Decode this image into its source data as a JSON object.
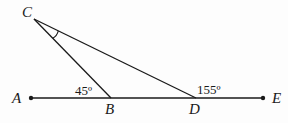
{
  "diagram": {
    "points": [
      {
        "name": "A",
        "x": 31,
        "y": 98
      },
      {
        "name": "B",
        "x": 111,
        "y": 98
      },
      {
        "name": "C",
        "x": 34,
        "y": 19
      },
      {
        "name": "D",
        "x": 196,
        "y": 98
      },
      {
        "name": "E",
        "x": 263,
        "y": 98
      }
    ],
    "labels": {
      "A": "A",
      "B": "B",
      "C": "C",
      "D": "D",
      "E": "E"
    },
    "angles": {
      "angle_CBA": "45º",
      "angle_CDE": "155º"
    },
    "segments": [
      "AE",
      "CB",
      "CD"
    ],
    "marked_angle": "BCD",
    "colors": {
      "stroke": "#1a1a1a",
      "background": "#fdfdfd"
    }
  }
}
